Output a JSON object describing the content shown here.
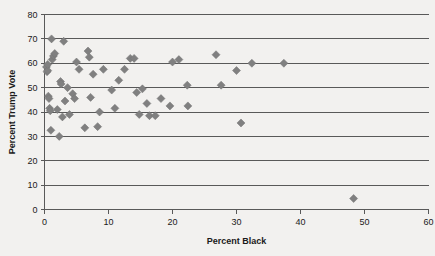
{
  "chart_data": {
    "type": "scatter",
    "title": "",
    "xlabel": "Percent Black",
    "ylabel": "Percent Trump Vote",
    "xlim": [
      0,
      60
    ],
    "ylim": [
      0,
      80
    ],
    "xticks": [
      0,
      10,
      20,
      30,
      40,
      50,
      60
    ],
    "yticks": [
      0,
      10,
      20,
      30,
      40,
      50,
      60,
      70,
      80
    ],
    "grid": "horizontal",
    "legend": "none",
    "marker": "diamond",
    "marker_color": "#808080",
    "series": [
      {
        "name": "Counties",
        "points": [
          [
            0.3,
            58.5
          ],
          [
            0.4,
            56.5
          ],
          [
            0.5,
            57.0
          ],
          [
            0.5,
            59.5
          ],
          [
            0.6,
            46.5
          ],
          [
            0.7,
            45.5
          ],
          [
            0.8,
            41.5
          ],
          [
            0.9,
            40.5
          ],
          [
            1.0,
            32.5
          ],
          [
            1.1,
            70.0
          ],
          [
            1.2,
            61.5
          ],
          [
            1.4,
            63.0
          ],
          [
            1.6,
            64.0
          ],
          [
            2.0,
            41.0
          ],
          [
            2.3,
            30.0
          ],
          [
            2.5,
            52.5
          ],
          [
            2.6,
            51.5
          ],
          [
            2.8,
            38.0
          ],
          [
            3.0,
            69.0
          ],
          [
            3.2,
            44.5
          ],
          [
            3.6,
            50.0
          ],
          [
            3.9,
            39.0
          ],
          [
            4.4,
            47.5
          ],
          [
            4.7,
            45.5
          ],
          [
            5.0,
            60.5
          ],
          [
            5.4,
            57.5
          ],
          [
            6.3,
            33.5
          ],
          [
            6.8,
            65.0
          ],
          [
            7.0,
            62.5
          ],
          [
            7.2,
            46.0
          ],
          [
            7.6,
            55.5
          ],
          [
            8.3,
            34.0
          ],
          [
            8.6,
            40.0
          ],
          [
            9.2,
            57.5
          ],
          [
            10.5,
            49.0
          ],
          [
            11.0,
            41.5
          ],
          [
            11.6,
            53.0
          ],
          [
            12.5,
            57.5
          ],
          [
            13.4,
            62.0
          ],
          [
            14.0,
            62.0
          ],
          [
            14.4,
            48.0
          ],
          [
            14.8,
            39.0
          ],
          [
            15.3,
            49.5
          ],
          [
            16.0,
            43.5
          ],
          [
            16.4,
            38.5
          ],
          [
            17.3,
            38.5
          ],
          [
            18.2,
            45.5
          ],
          [
            19.6,
            42.5
          ],
          [
            20.0,
            60.5
          ],
          [
            21.0,
            61.5
          ],
          [
            22.3,
            51.0
          ],
          [
            22.4,
            42.5
          ],
          [
            26.8,
            63.5
          ],
          [
            27.6,
            51.0
          ],
          [
            30.0,
            57.0
          ],
          [
            30.7,
            35.5
          ],
          [
            32.4,
            60.0
          ],
          [
            37.4,
            60.0
          ],
          [
            48.3,
            4.5
          ]
        ]
      }
    ]
  },
  "axis": {
    "y_title": "Percent Trump Vote",
    "x_title": "Percent Black"
  }
}
